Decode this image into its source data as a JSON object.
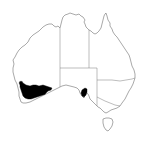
{
  "map": {
    "title": "Distribution map — Australia",
    "region": "Australia",
    "colors": {
      "background": "#ffffff",
      "coastline": "#6e6e6e",
      "state_borders": "#7a7a7a",
      "occurrence_fill": "#000000"
    },
    "states": [
      {
        "id": "wa",
        "label": "Western Australia"
      },
      {
        "id": "nt",
        "label": "Northern Territory"
      },
      {
        "id": "sa",
        "label": "South Australia"
      },
      {
        "id": "qld",
        "label": "Queensland"
      },
      {
        "id": "nsw",
        "label": "New South Wales"
      },
      {
        "id": "vic",
        "label": "Victoria"
      },
      {
        "id": "tas",
        "label": "Tasmania"
      }
    ],
    "occurrence_regions": [
      {
        "id": "southwest-wa",
        "label": "South-west Western Australia"
      },
      {
        "id": "south-australia",
        "label": "South Australia (Eyre Peninsula)"
      }
    ]
  }
}
